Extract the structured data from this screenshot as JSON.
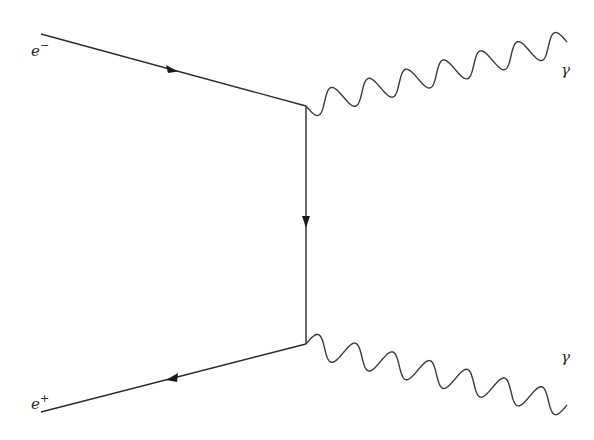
{
  "diagram": {
    "type": "feynman",
    "process": "electron-positron annihilation into two photons",
    "vertices": {
      "top": {
        "x": 306,
        "y": 106
      },
      "bottom": {
        "x": 306,
        "y": 344
      }
    },
    "external_lines": {
      "electron": {
        "label": "e",
        "charge_sup": "−",
        "start": {
          "x": 41,
          "y": 34
        },
        "end": {
          "x": 306,
          "y": 106
        },
        "arrow": "toward-vertex"
      },
      "positron": {
        "label": "e",
        "charge_sup": "+",
        "start": {
          "x": 41,
          "y": 412
        },
        "end": {
          "x": 306,
          "y": 344
        },
        "arrow": "away-from-vertex"
      },
      "photon_top": {
        "label": "γ",
        "start": {
          "x": 306,
          "y": 106
        },
        "end": {
          "x": 567,
          "y": 42
        },
        "wavelengths": 7
      },
      "photon_bottom": {
        "label": "γ",
        "start": {
          "x": 306,
          "y": 344
        },
        "end": {
          "x": 567,
          "y": 405
        },
        "wavelengths": 7
      }
    },
    "internal_line": {
      "type": "electron-propagator",
      "start": {
        "x": 306,
        "y": 106
      },
      "end": {
        "x": 306,
        "y": 344
      },
      "arrow": "down"
    }
  }
}
